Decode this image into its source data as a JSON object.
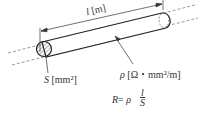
{
  "diagram": {
    "length_label": {
      "symbol": "l",
      "unit": "[m]"
    },
    "area_label": {
      "symbol": "S",
      "unit": "[mm²]"
    },
    "resistivity_label": {
      "symbol": "ρ",
      "unit": "[Ω・mm²/m]"
    },
    "formula": {
      "lhs": "R",
      "eq": "=",
      "coef": "ρ",
      "num": "l",
      "den": "S"
    },
    "colors": {
      "stroke": "#333333",
      "dashed": "#555555",
      "hatch": "#444444"
    }
  }
}
